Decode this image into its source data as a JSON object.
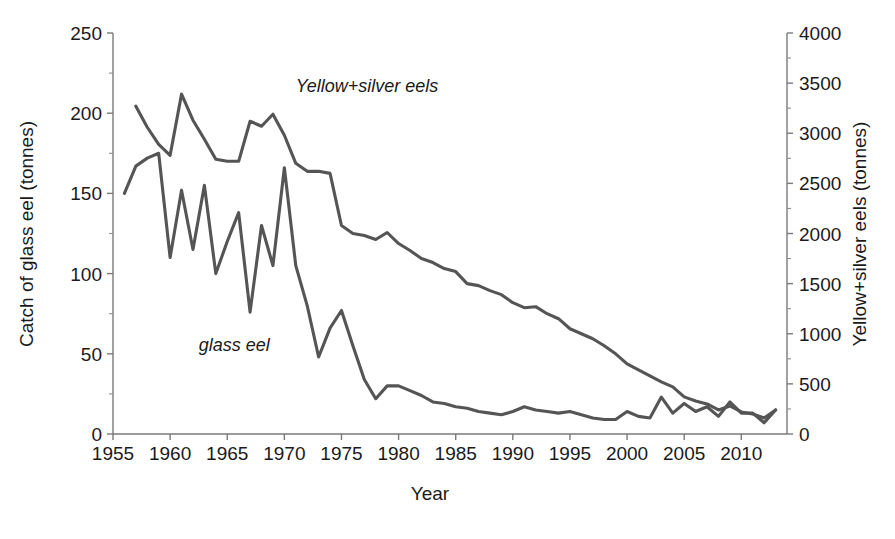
{
  "chart_data": {
    "type": "line",
    "title": "",
    "xlabel": "Year",
    "ylabel": "Catch of glass eel (tonnes)",
    "y2label": "Yellow+silver eels (tonnes)",
    "xlim": [
      1955,
      2014
    ],
    "ylim": [
      0,
      250
    ],
    "y2lim": [
      0,
      4000
    ],
    "grid": false,
    "legend_position": "inside-plot-annotations",
    "xticks": [
      1955,
      1960,
      1965,
      1970,
      1975,
      1980,
      1985,
      1990,
      1995,
      2000,
      2005,
      2010
    ],
    "yticks": [
      0,
      50,
      100,
      150,
      200,
      250
    ],
    "y2ticks": [
      0,
      500,
      1000,
      1500,
      2000,
      2500,
      3000,
      3500,
      4000
    ],
    "annotations": [
      {
        "text": "Yellow+silver eels",
        "x": 1971,
        "y": 213,
        "style": "italic"
      },
      {
        "text": "glass eel",
        "x": 1962.5,
        "y": 52,
        "style": "italic"
      }
    ],
    "series": [
      {
        "name": "glass eel",
        "axis": "left",
        "units": "tonnes",
        "color": "#555555",
        "x": [
          1956,
          1957,
          1958,
          1959,
          1960,
          1961,
          1962,
          1963,
          1964,
          1965,
          1966,
          1967,
          1968,
          1969,
          1970,
          1971,
          1972,
          1973,
          1974,
          1975,
          1976,
          1977,
          1978,
          1979,
          1980,
          1981,
          1982,
          1983,
          1984,
          1985,
          1986,
          1987,
          1988,
          1989,
          1990,
          1991,
          1992,
          1993,
          1994,
          1995,
          1996,
          1997,
          1998,
          1999,
          2000,
          2001,
          2002,
          2003,
          2004,
          2005,
          2006,
          2007,
          2008,
          2009,
          2010,
          2011,
          2012,
          2013
        ],
        "values": [
          150,
          167,
          172,
          175,
          110,
          152,
          115,
          155,
          100,
          120,
          138,
          76,
          130,
          105,
          166,
          105,
          80,
          48,
          66,
          77,
          55,
          34,
          22,
          30,
          30,
          27,
          24,
          20,
          19,
          17,
          16,
          14,
          13,
          12,
          14,
          17,
          15,
          14,
          13,
          14,
          12,
          10,
          9,
          9,
          14,
          11,
          10,
          23,
          13,
          19,
          14,
          17,
          11,
          20,
          13,
          13,
          7,
          15
        ]
      },
      {
        "name": "Yellow+silver eels",
        "axis": "right",
        "units": "tonnes",
        "color": "#555555",
        "x": [
          1957,
          1958,
          1959,
          1960,
          1961,
          1962,
          1963,
          1964,
          1965,
          1966,
          1967,
          1968,
          1969,
          1970,
          1971,
          1972,
          1973,
          1974,
          1975,
          1976,
          1977,
          1978,
          1979,
          1980,
          1981,
          1982,
          1983,
          1984,
          1985,
          1986,
          1987,
          1988,
          1989,
          1990,
          1991,
          1992,
          1993,
          1994,
          1995,
          1996,
          1997,
          1998,
          1999,
          2000,
          2001,
          2002,
          2003,
          2004,
          2005,
          2006,
          2007,
          2008,
          2009,
          2010,
          2011,
          2012,
          2013
        ],
        "values": [
          3270,
          3060,
          2890,
          2780,
          3390,
          3130,
          2940,
          2740,
          2720,
          2720,
          3120,
          3070,
          3190,
          2980,
          2700,
          2620,
          2620,
          2600,
          2080,
          2000,
          1980,
          1940,
          2010,
          1900,
          1830,
          1750,
          1710,
          1650,
          1620,
          1500,
          1480,
          1430,
          1390,
          1310,
          1260,
          1270,
          1200,
          1150,
          1050,
          1000,
          950,
          880,
          800,
          700,
          640,
          580,
          520,
          470,
          370,
          330,
          300,
          240,
          280,
          220,
          200,
          160,
          240
        ]
      }
    ]
  },
  "axes": {
    "left": {
      "title": "Catch of glass eel (tonnes)",
      "ticks": [
        "250",
        "200",
        "150",
        "100",
        "50",
        "0"
      ]
    },
    "right": {
      "title": "Yellow+silver eels (tonnes)",
      "ticks": [
        "4000",
        "3500",
        "3000",
        "2500",
        "2000",
        "1500",
        "1000",
        "500",
        "0"
      ]
    },
    "bottom": {
      "title": "Year",
      "ticks": [
        "1955",
        "1960",
        "1965",
        "1970",
        "1975",
        "1980",
        "1985",
        "1990",
        "1995",
        "2000",
        "2005",
        "2010"
      ]
    }
  },
  "annotations": {
    "yellow_silver": "Yellow+silver eels",
    "glass_eel": "glass eel"
  },
  "colors": {
    "line": "#555555",
    "axis": "#7a7a7a",
    "text": "#1a1a1a",
    "background": "#ffffff"
  }
}
